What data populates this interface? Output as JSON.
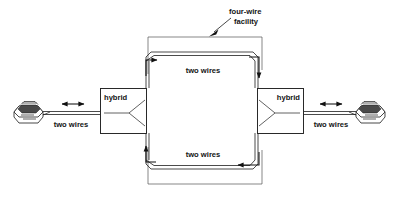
{
  "figure": {
    "type": "diagram",
    "background_color": "#ffffff",
    "line_color": "#1f1f1f",
    "text_color": "#141414"
  },
  "labels": {
    "four_wire_facility": "four-wire\nfacility",
    "four_wire_facility_line1": "four-wire",
    "four_wire_facility_line2": "facility",
    "top_pair": "two wires",
    "bottom_pair": "two wires",
    "left_local_loop": "two wires",
    "right_local_loop": "two wires",
    "hybrid_left": "hybrid",
    "hybrid_right": "hybrid"
  },
  "nodes": [
    {
      "id": "phone-left",
      "name": "telephone-left",
      "label": ""
    },
    {
      "id": "hybrid-left",
      "name": "hybrid-left",
      "label": "hybrid"
    },
    {
      "id": "hybrid-right",
      "name": "hybrid-right",
      "label": "hybrid"
    },
    {
      "id": "phone-right",
      "name": "telephone-right",
      "label": ""
    }
  ],
  "links": [
    {
      "from": "phone-left",
      "to": "hybrid-left",
      "label": "two wires",
      "arrow": "bidirectional"
    },
    {
      "from": "hybrid-left",
      "to": "hybrid-right",
      "label": "two wires",
      "arrow": "right",
      "path": "top"
    },
    {
      "from": "hybrid-right",
      "to": "hybrid-left",
      "label": "two wires",
      "arrow": "left",
      "path": "bottom"
    },
    {
      "from": "hybrid-right",
      "to": "phone-right",
      "label": "two wires",
      "arrow": "bidirectional"
    }
  ],
  "annotation": {
    "text_line1": "four-wire",
    "text_line2": "facility",
    "points_to": "four-wire facility boundary"
  }
}
